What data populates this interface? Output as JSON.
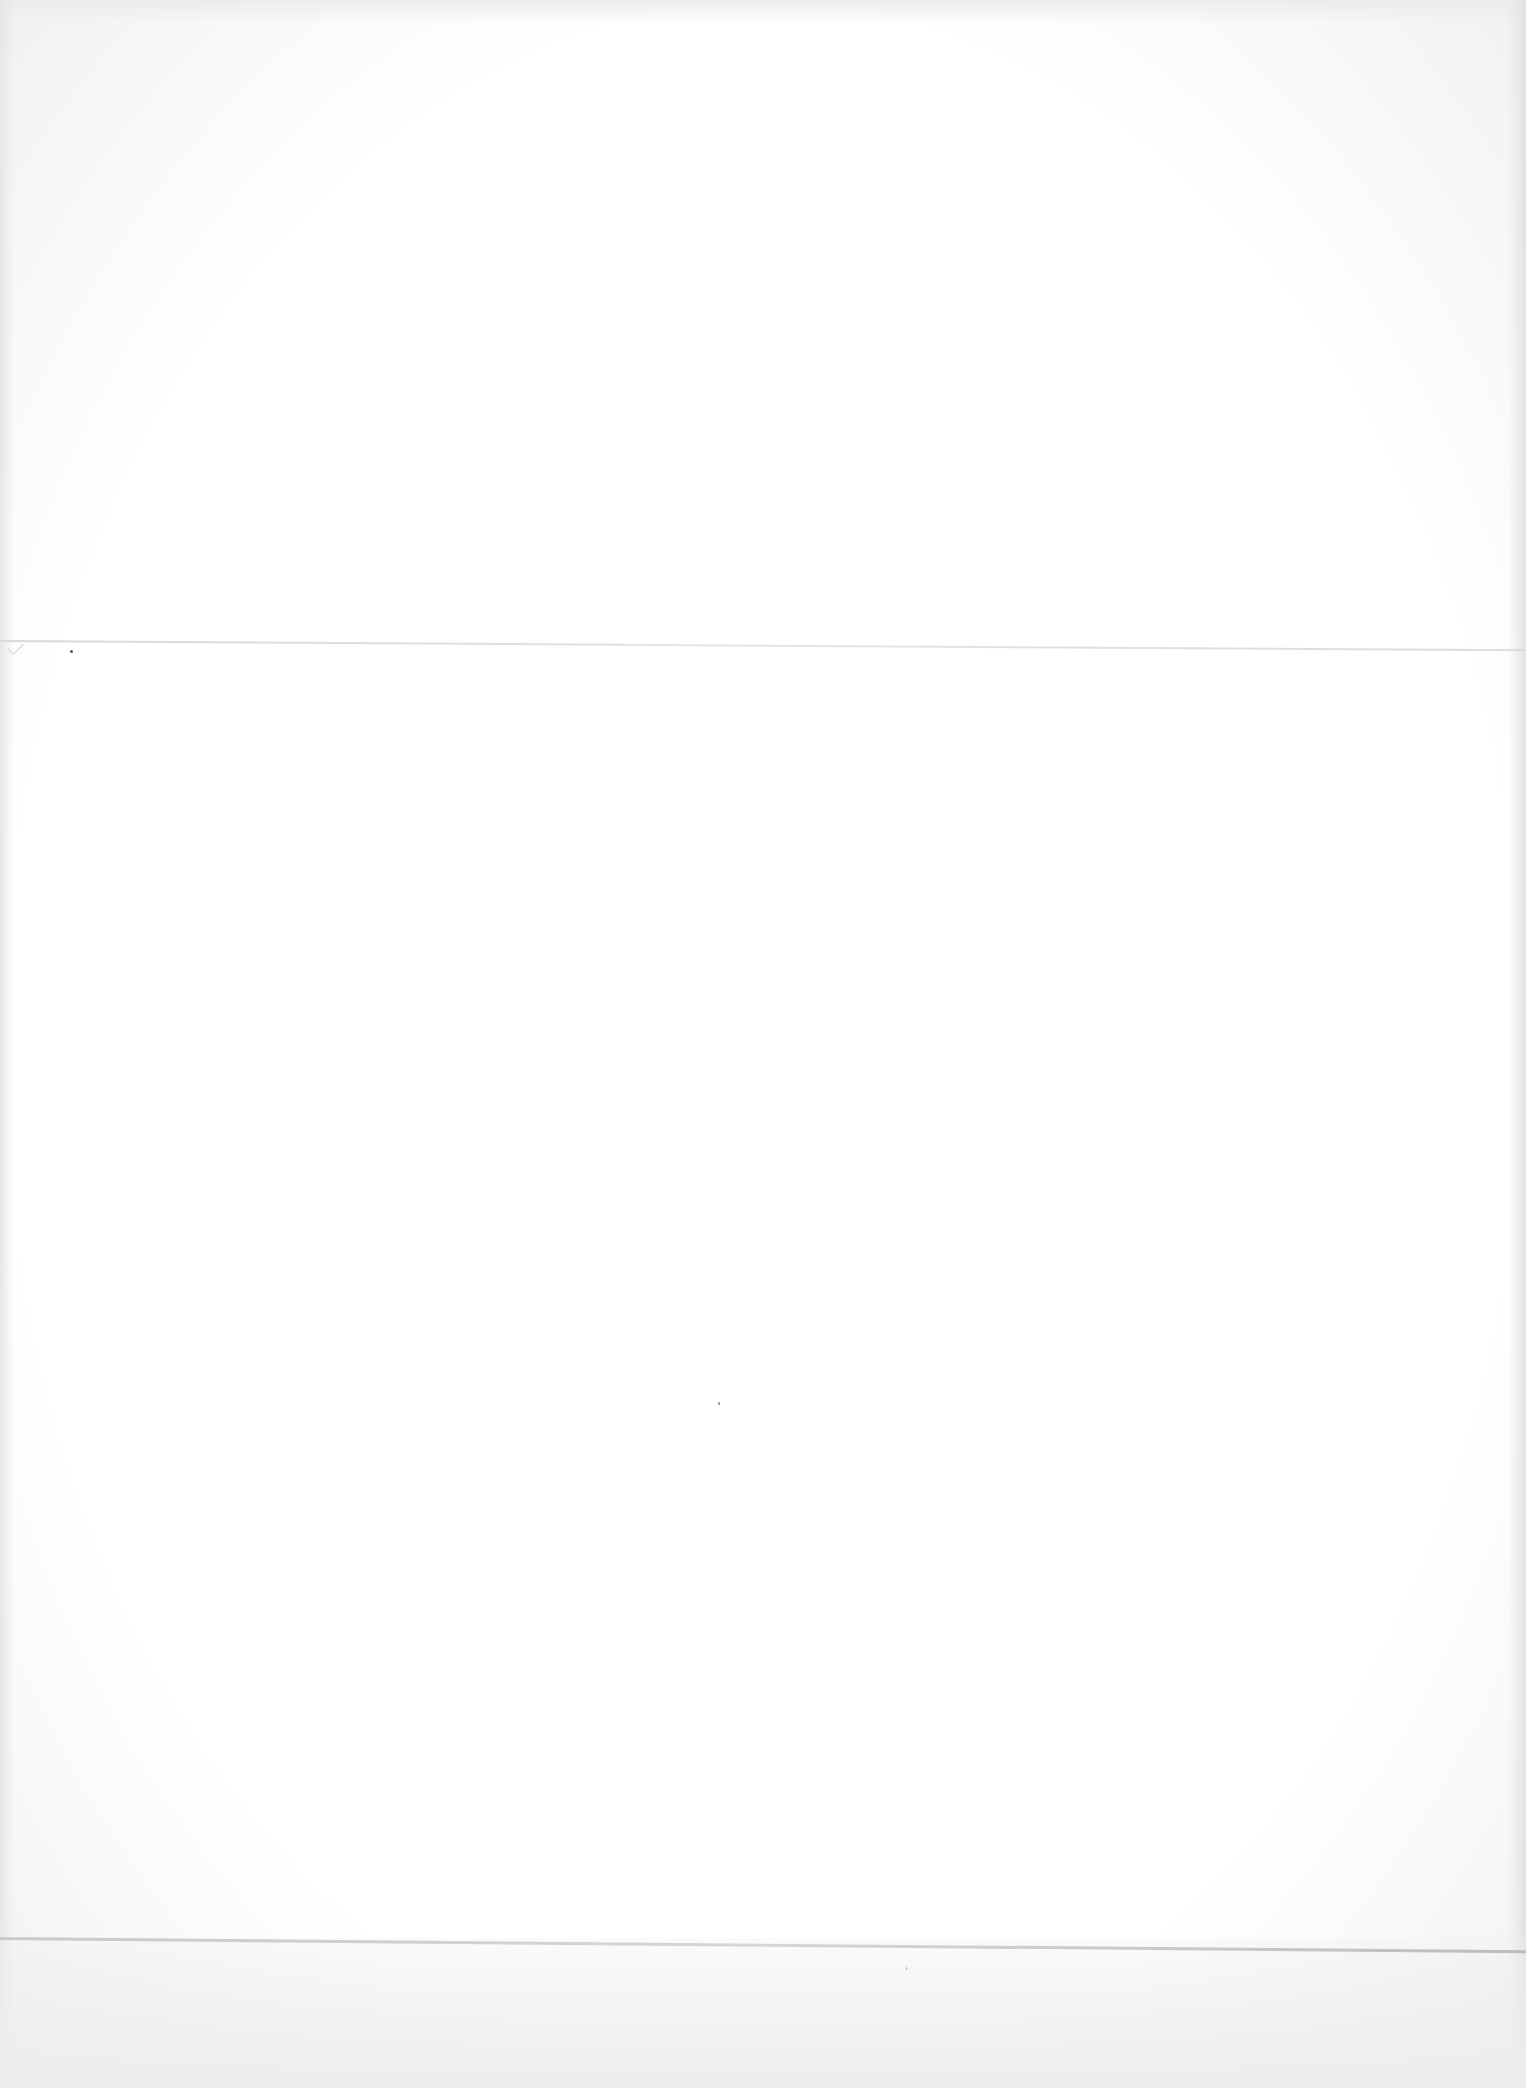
{
  "document": {
    "type": "blank-scanned-page",
    "text": ""
  },
  "colors": {
    "paper": "#fdfdfd",
    "fold_line": "#c9c9c9"
  }
}
